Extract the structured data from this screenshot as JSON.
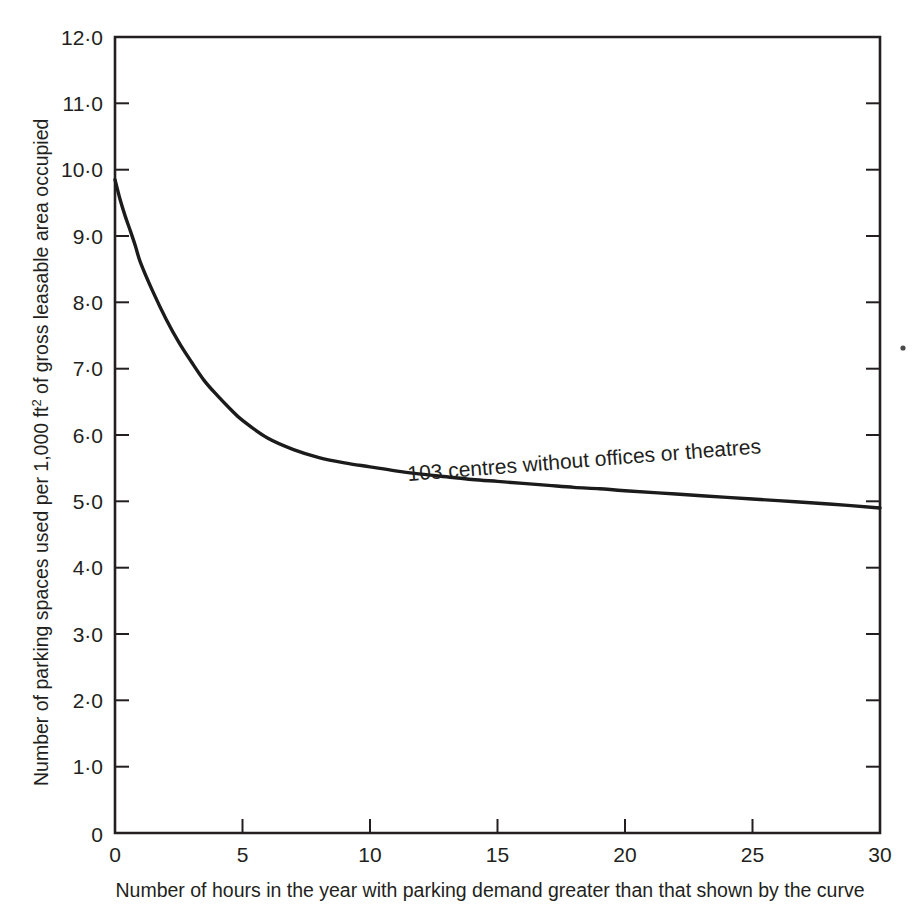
{
  "chart_data": {
    "type": "line",
    "title": "",
    "subtitle": "",
    "xlabel": "Number of hours in the year with parking demand greater than that shown by the curve",
    "ylabel_parts": {
      "before": "Number of parking spaces used per 1,000 ft",
      "superscript": "2",
      "after": " of gross leasable area occupied"
    },
    "ylabel": "Number of parking spaces used per 1,000 ft2 of gross leasable area occupied",
    "xlim": [
      0,
      30
    ],
    "ylim": [
      0,
      12
    ],
    "grid": false,
    "legend": "none",
    "xticks": [
      0,
      5,
      10,
      15,
      20,
      25,
      30
    ],
    "xticklabels": [
      "0",
      "5",
      "10",
      "15",
      "20",
      "25",
      "30"
    ],
    "yticks": [
      0,
      1,
      2,
      3,
      4,
      5,
      6,
      7,
      8,
      9,
      10,
      11,
      12
    ],
    "yticklabels": [
      "0",
      "1·0",
      "2·0",
      "3·0",
      "4·0",
      "5·0",
      "6·0",
      "7·0",
      "8·0",
      "9·0",
      "10·0",
      "11·0",
      "12·0"
    ],
    "annotations": [
      {
        "text": "103 centres without offices or theatres",
        "x": 7.2,
        "y": 5.85,
        "rotation": -4.5
      }
    ],
    "series": [
      {
        "name": "103 centres without offices or theatres",
        "color": "#1b1b1b",
        "x": [
          0,
          0.2,
          0.4,
          0.6,
          0.8,
          1.0,
          1.5,
          2.0,
          2.5,
          3.0,
          3.5,
          4.0,
          4.5,
          5.0,
          6.0,
          7.0,
          8.0,
          9.0,
          10.0,
          11.0,
          12.0,
          13.0,
          14.0,
          15.0,
          16.0,
          17.0,
          18.0,
          19.0,
          20.0,
          22.0,
          24.0,
          26.0,
          28.0,
          30.0
        ],
        "y": [
          9.85,
          9.55,
          9.3,
          9.08,
          8.85,
          8.6,
          8.15,
          7.75,
          7.4,
          7.1,
          6.82,
          6.6,
          6.4,
          6.22,
          5.95,
          5.78,
          5.66,
          5.58,
          5.52,
          5.46,
          5.41,
          5.37,
          5.33,
          5.3,
          5.27,
          5.24,
          5.21,
          5.19,
          5.16,
          5.11,
          5.06,
          5.01,
          4.96,
          4.9
        ]
      }
    ],
    "axis_ticks_direction": "inward",
    "frame": "full-box"
  },
  "figure": {
    "background_color": "#ffffff",
    "line_color": "#231f20",
    "speck_marks": [
      {
        "name": "print-speck",
        "x": 903,
        "y": 348
      }
    ]
  }
}
